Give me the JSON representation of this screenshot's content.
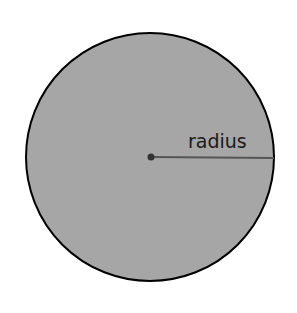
{
  "diagram": {
    "label": "radius",
    "colors": {
      "fill": "#a6a6a6",
      "stroke": "#000000",
      "radius_line": "#555555",
      "center_dot": "#333333"
    }
  }
}
